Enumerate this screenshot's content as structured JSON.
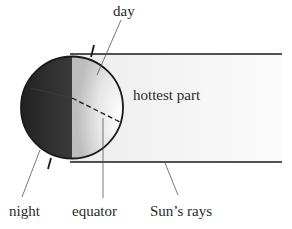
{
  "diagram": {
    "labels": {
      "day": "day",
      "hottest_part": "hottest part",
      "night": "night",
      "equator": "equator",
      "suns_rays": "Sun’s rays"
    },
    "colors": {
      "night_side": "#2b2b2b",
      "day_side_light": "#f4f4f4",
      "day_side_shadow": "#c9c9c9",
      "rays_fill": "#f7f7f7",
      "outline": "#1a1a1a",
      "leader_line": "#555555"
    }
  }
}
